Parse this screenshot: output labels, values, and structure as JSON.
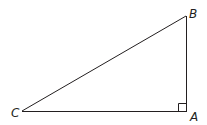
{
  "diagram": {
    "type": "right-triangle",
    "stroke_color": "#231f20",
    "background": "#ffffff",
    "vertices": {
      "A": {
        "label": "A",
        "x": 187,
        "y": 111,
        "label_x": 190,
        "label_y": 121
      },
      "B": {
        "label": "B",
        "x": 186,
        "y": 16,
        "label_x": 189,
        "label_y": 18
      },
      "C": {
        "label": "C",
        "x": 22,
        "y": 111,
        "label_x": 12,
        "label_y": 117
      }
    },
    "right_angle_at": "A",
    "right_angle_marker_size": 8,
    "edges": [
      {
        "from": "C",
        "to": "B"
      },
      {
        "from": "B",
        "to": "A"
      },
      {
        "from": "A",
        "to": "C"
      }
    ]
  }
}
